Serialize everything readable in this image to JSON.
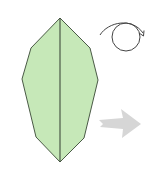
{
  "diagram": {
    "type": "origami-step",
    "colors": {
      "paper_fill": "#c6e8b8",
      "paper_outline": "#4a5a46",
      "crease_line": "#3f4a3c",
      "turn_over_symbol": "#444444",
      "next_arrow": "#d6d6d6",
      "background": "#ffffff"
    },
    "shape": {
      "name": "leaf",
      "vertices": [
        [
          60,
          18
        ],
        [
          90,
          48
        ],
        [
          98,
          80
        ],
        [
          84,
          138
        ],
        [
          60,
          162
        ],
        [
          36,
          137
        ],
        [
          22,
          79
        ],
        [
          31,
          48
        ]
      ],
      "center_crease": {
        "from": [
          60,
          18
        ],
        "to": [
          60,
          162
        ]
      }
    },
    "symbols": [
      {
        "name": "turn-over-icon",
        "meaning": "turn over",
        "center": [
          126,
          37
        ],
        "radius": 14
      },
      {
        "name": "next-step-arrow-icon",
        "meaning": "next step",
        "direction": "right"
      }
    ]
  }
}
